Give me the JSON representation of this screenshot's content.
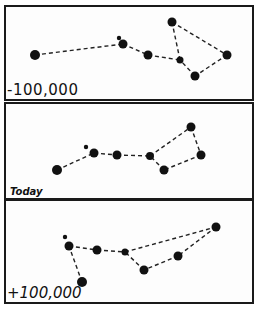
{
  "figure": {
    "panels": [
      {
        "label": "-100,000",
        "stars": [
          {
            "x": 35,
            "y": 55,
            "r": 5
          },
          {
            "x": 123,
            "y": 44,
            "r": 4.5
          },
          {
            "x": 119,
            "y": 38,
            "r": 2.2
          },
          {
            "x": 148,
            "y": 55,
            "r": 4.5
          },
          {
            "x": 180,
            "y": 60,
            "r": 3.5
          },
          {
            "x": 172,
            "y": 22,
            "r": 4.5
          },
          {
            "x": 227,
            "y": 55,
            "r": 4.5
          },
          {
            "x": 195,
            "y": 76,
            "r": 4.5
          }
        ]
      },
      {
        "label": "Today",
        "stars": [
          {
            "x": 57,
            "y": 170,
            "r": 5
          },
          {
            "x": 94,
            "y": 153,
            "r": 4.5
          },
          {
            "x": 86,
            "y": 147,
            "r": 2.2
          },
          {
            "x": 117,
            "y": 155,
            "r": 4.5
          },
          {
            "x": 150,
            "y": 156,
            "r": 4
          },
          {
            "x": 191,
            "y": 127,
            "r": 4.5
          },
          {
            "x": 201,
            "y": 155,
            "r": 4.5
          },
          {
            "x": 164,
            "y": 170,
            "r": 4.5
          }
        ]
      },
      {
        "label": "+100,000",
        "stars": [
          {
            "x": 82,
            "y": 282,
            "r": 5
          },
          {
            "x": 69,
            "y": 246,
            "r": 4.5
          },
          {
            "x": 65,
            "y": 237,
            "r": 2.2
          },
          {
            "x": 97,
            "y": 250,
            "r": 4.5
          },
          {
            "x": 125,
            "y": 252,
            "r": 3.5
          },
          {
            "x": 216,
            "y": 227,
            "r": 4.5
          },
          {
            "x": 178,
            "y": 256,
            "r": 4.5
          },
          {
            "x": 144,
            "y": 270,
            "r": 4.5
          }
        ]
      }
    ],
    "colors": {
      "star": "#111111",
      "line": "#222222",
      "border": "#1a1a1a",
      "background": "#fdfdfd"
    }
  }
}
